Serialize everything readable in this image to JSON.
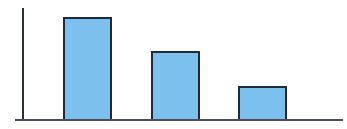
{
  "chart_data": {
    "type": "bar",
    "title": "",
    "xlabel": "",
    "ylabel": "",
    "categories": [
      "",
      "",
      ""
    ],
    "values": [
      3,
      2,
      1
    ],
    "ylim": [
      0,
      3.3
    ],
    "grid": false,
    "legend": null,
    "colors": {
      "bar_fill": "#7cc0ee",
      "bar_edge": "#1f2a3a",
      "axis": "#2b2f36"
    }
  }
}
